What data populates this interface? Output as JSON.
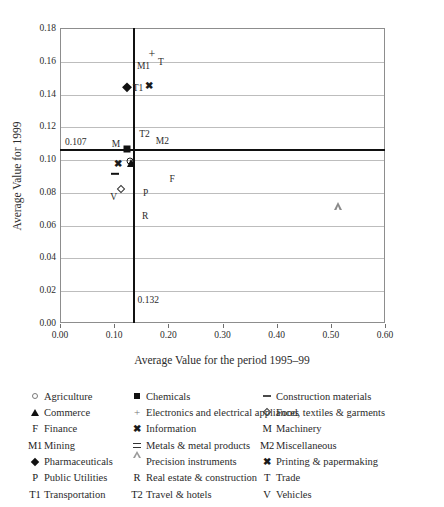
{
  "chart_data": {
    "type": "scatter",
    "title": "",
    "xlabel": "Average Value for the period 1995–99",
    "ylabel": "Average Value for 1999",
    "xlim": [
      0.0,
      0.6
    ],
    "ylim": [
      0.0,
      0.18
    ],
    "xticks": [
      "0.00",
      "0.10",
      "0.20",
      "0.30",
      "0.40",
      "0.50",
      "0.60"
    ],
    "xtick_values": [
      0.0,
      0.1,
      0.2,
      0.3,
      0.4,
      0.5,
      0.6
    ],
    "yticks": [
      "0.00",
      "0.02",
      "0.04",
      "0.06",
      "0.08",
      "0.10",
      "0.12",
      "0.14",
      "0.16",
      "0.18"
    ],
    "ytick_values": [
      0.0,
      0.02,
      0.04,
      0.06,
      0.08,
      0.1,
      0.12,
      0.14,
      0.16,
      0.18
    ],
    "grid": "horizontal",
    "legend_position": "below",
    "reference_lines": [
      {
        "name": "horizontal-mean-line",
        "orientation": "horizontal",
        "value": 0.107,
        "label": "0.107"
      },
      {
        "name": "vertical-mean-line",
        "orientation": "vertical",
        "value": 0.132,
        "label": "0.132"
      }
    ],
    "points": [
      {
        "label": "M1",
        "marker": "text-m1",
        "x": 0.132,
        "y": 0.158,
        "series": "Mining",
        "label_pos": "right"
      },
      {
        "label": "T",
        "marker": "plus",
        "x": 0.168,
        "y": 0.165,
        "series": "Electronics and electrical appliances",
        "label_pos": "below-right"
      },
      {
        "label": "T1",
        "marker": "diamond-filled",
        "x": 0.122,
        "y": 0.1445,
        "series": "Pharmaceuticals",
        "label_pos": "right"
      },
      {
        "label": "",
        "marker": "x-bold",
        "x": 0.163,
        "y": 0.1455,
        "series": "Information",
        "label_pos": "none"
      },
      {
        "label": "T2",
        "marker": "text-t2",
        "x": 0.134,
        "y": 0.1165,
        "series": "Travel & hotels",
        "label_pos": "right"
      },
      {
        "label": "M2",
        "marker": "text-m2",
        "x": 0.167,
        "y": 0.1125,
        "series": "Miscellaneous",
        "label_pos": "right"
      },
      {
        "label": "M",
        "marker": "square-filled",
        "x": 0.122,
        "y": 0.1065,
        "series": "Chemicals",
        "label_pos": "left"
      },
      {
        "label": "",
        "marker": "circle-open",
        "x": 0.128,
        "y": 0.0995,
        "series": "Agriculture",
        "label_pos": "none"
      },
      {
        "label": "",
        "marker": "triangle-filled",
        "x": 0.13,
        "y": 0.0985,
        "series": "Commerce",
        "label_pos": "none"
      },
      {
        "label": "",
        "marker": "x-bold",
        "x": 0.106,
        "y": 0.0975,
        "series": "Printing & papermaking",
        "label_pos": "none"
      },
      {
        "label": "",
        "marker": "dash",
        "x": 0.099,
        "y": 0.0915,
        "series": "Construction materials",
        "label_pos": "none"
      },
      {
        "label": "V",
        "marker": "diamond-open",
        "x": 0.11,
        "y": 0.0825,
        "series": "Food, textiles & garments",
        "label_pos": "below-left"
      },
      {
        "label": "P",
        "marker": "text-p",
        "x": 0.136,
        "y": 0.0805,
        "series": "Public Utilities",
        "label_pos": "right"
      },
      {
        "label": "F",
        "marker": "text-f",
        "x": 0.205,
        "y": 0.0885,
        "series": "Finance",
        "label_pos": "self"
      },
      {
        "label": "R",
        "marker": "text-r",
        "x": 0.135,
        "y": 0.0665,
        "series": "Real estate & construction",
        "label_pos": "right"
      },
      {
        "label": "",
        "marker": "triangle-open",
        "x": 0.512,
        "y": 0.067,
        "series": "Precision instruments",
        "label_pos": "none"
      }
    ]
  },
  "axes": {
    "y_title": "Average Value for 1999",
    "x_title": "Average Value for the period 1995–99"
  },
  "annotations": {
    "h_ref": "0.107",
    "v_ref": "0.132"
  },
  "legend": {
    "columns": [
      {
        "name": "legend-column-1",
        "items": [
          {
            "symbol": "circle-open",
            "glyph": "",
            "label": "Agriculture"
          },
          {
            "symbol": "triangle-filled",
            "glyph": "",
            "label": "Commerce"
          },
          {
            "symbol": "text",
            "glyph": "F",
            "label": "Finance"
          },
          {
            "symbol": "text",
            "glyph": "M1",
            "label": "Mining"
          },
          {
            "symbol": "diamond-filled",
            "glyph": "",
            "label": "Pharmaceuticals"
          },
          {
            "symbol": "text",
            "glyph": "P",
            "label": "Public Utilities"
          },
          {
            "symbol": "text",
            "glyph": "T1",
            "label": "Transportation"
          }
        ]
      },
      {
        "name": "legend-column-2",
        "items": [
          {
            "symbol": "square-filled",
            "glyph": "",
            "label": "Chemicals"
          },
          {
            "symbol": "plus",
            "glyph": "",
            "label": "Electronics and electrical appliances"
          },
          {
            "symbol": "x-bold",
            "glyph": "",
            "label": "Information"
          },
          {
            "symbol": "equals",
            "glyph": "",
            "label": "Metals & metal products"
          },
          {
            "symbol": "triangle-open",
            "glyph": "",
            "label": "Precision instruments"
          },
          {
            "symbol": "text",
            "glyph": "R",
            "label": "Real estate & construction"
          },
          {
            "symbol": "text",
            "glyph": "T2",
            "label": "Travel & hotels"
          }
        ]
      },
      {
        "name": "legend-column-3",
        "items": [
          {
            "symbol": "dash",
            "glyph": "",
            "label": "Construction materials"
          },
          {
            "symbol": "diamond-open",
            "glyph": "",
            "label": "Food, textiles & garments"
          },
          {
            "symbol": "text",
            "glyph": "M",
            "label": "Machinery"
          },
          {
            "symbol": "text",
            "glyph": "M2",
            "label": "Miscellaneous"
          },
          {
            "symbol": "x-bold",
            "glyph": "",
            "label": "Printing & papermaking"
          },
          {
            "symbol": "text",
            "glyph": "T",
            "label": "Trade"
          },
          {
            "symbol": "text",
            "glyph": "V",
            "label": "Vehicles"
          }
        ]
      }
    ]
  },
  "colors": {
    "axis": "#8d8d8d",
    "grid": "#bdbdbd",
    "reference_line": "#111111",
    "marker": "#1a1a1a",
    "text": "#2b2b2b",
    "background": "#ffffff"
  }
}
